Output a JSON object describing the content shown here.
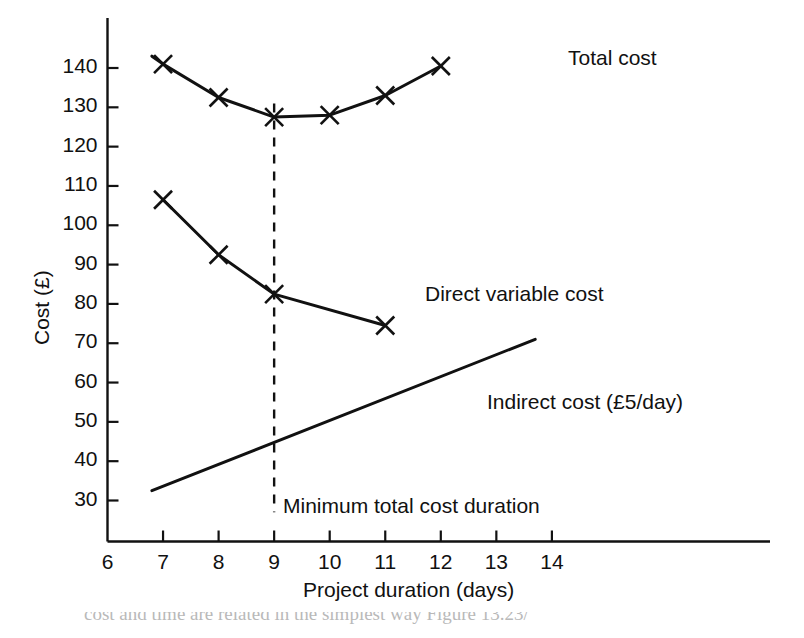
{
  "chart_data": {
    "type": "line",
    "title": "",
    "xlabel": "Project duration (days)",
    "ylabel": "Cost (£)",
    "xlim": [
      6,
      14.8
    ],
    "ylim": [
      24,
      148
    ],
    "xticks": [
      6,
      7,
      8,
      9,
      10,
      11,
      12,
      13,
      14
    ],
    "xtick_labels": [
      "6",
      "7",
      "8",
      "9",
      "10",
      "11",
      "12",
      "13",
      "14"
    ],
    "yticks": [
      30,
      40,
      50,
      60,
      70,
      80,
      90,
      100,
      110,
      120,
      130,
      140
    ],
    "ytick_labels": [
      "30",
      "40",
      "50",
      "60",
      "70",
      "80",
      "90",
      "100",
      "110",
      "120",
      "130",
      "140"
    ],
    "grid": false,
    "legend_position": "inline-annotations",
    "series": [
      {
        "name": "Total cost",
        "label": "Total cost",
        "marker": "x",
        "marker_points": true,
        "line_extends_before": true,
        "extend_start": {
          "x": 6.8,
          "y": 143.0
        },
        "x": [
          7,
          8,
          9,
          10,
          11,
          12
        ],
        "values": [
          141.0,
          132.5,
          127.5,
          128.0,
          133.0,
          140.5
        ]
      },
      {
        "name": "Direct variable cost",
        "label": "Direct variable cost",
        "marker": "x",
        "marker_points": true,
        "line_extends_before": false,
        "x": [
          7,
          8,
          9,
          11
        ],
        "values": [
          106.5,
          92.5,
          82.5,
          74.5
        ]
      },
      {
        "name": "Indirect cost",
        "label": "Indirect cost (£5/day)",
        "marker": "none",
        "marker_points": false,
        "slope_per_day": 5,
        "x": [
          6.8,
          13.7
        ],
        "values": [
          32.5,
          71.0
        ]
      }
    ],
    "annotations": [
      {
        "name": "minimum-total-cost-duration",
        "text": "Minimum total cost duration",
        "x": 9,
        "y": 30,
        "type": "vertical-dashed-line",
        "line_x": 9,
        "line_y_from": 27,
        "line_y_to": 131
      }
    ],
    "series_labels": [
      {
        "key": "total-cost",
        "text": "Total cost",
        "x": 12.2,
        "y": 140.5
      },
      {
        "key": "direct-variable-cost",
        "text": "Direct variable cost",
        "x": 11.45,
        "y": 83.5
      },
      {
        "key": "indirect-cost",
        "text": "Indirect cost (£5/day)",
        "x": 12.55,
        "y": 61.5
      }
    ]
  },
  "axes": {
    "x_axis_title": "Project duration (days)",
    "y_axis_title": "Cost (£)"
  },
  "footer": {
    "caption_fragment": "cost and time are related in the simplest way  Figure 13.23/"
  },
  "colors": {
    "background": "#ffffff",
    "ink": "#111111",
    "line": "#111111",
    "caption": "#b9b9b9"
  }
}
